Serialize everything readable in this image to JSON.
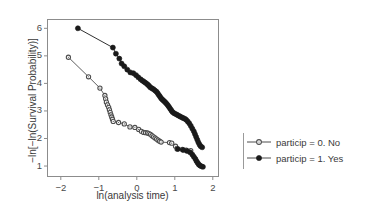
{
  "chart_data": {
    "type": "line",
    "title": "",
    "xlabel": "ln(analysis time)",
    "ylabel": "−ln[−ln(Survival Probability)]",
    "xlim": [
      -2.35,
      2.15
    ],
    "ylim": [
      0.62,
      6.32
    ],
    "xticks": [
      -2,
      -1,
      0,
      1,
      2
    ],
    "xticklabels": [
      "−2",
      "−1",
      "0",
      "1",
      "2"
    ],
    "yticks": [
      1,
      2,
      3,
      4,
      5,
      6
    ],
    "yticklabels": [
      "1",
      "2",
      "3",
      "4",
      "5",
      "6"
    ],
    "grid": false,
    "legend_position": "right",
    "frame": true,
    "series": [
      {
        "name": "particip = 0. No",
        "marker": "open-circle",
        "color": "#4d4d4d",
        "points": [
          [
            -1.8,
            4.95
          ],
          [
            -1.27,
            4.24
          ],
          [
            -0.97,
            3.83
          ],
          [
            -0.84,
            3.56
          ],
          [
            -0.82,
            3.44
          ],
          [
            -0.8,
            3.32
          ],
          [
            -0.77,
            3.22
          ],
          [
            -0.74,
            3.13
          ],
          [
            -0.72,
            3.04
          ],
          [
            -0.7,
            2.95
          ],
          [
            -0.68,
            2.86
          ],
          [
            -0.66,
            2.78
          ],
          [
            -0.64,
            2.7
          ],
          [
            -0.62,
            2.62
          ],
          [
            -0.48,
            2.58
          ],
          [
            -0.33,
            2.53
          ],
          [
            -0.18,
            2.42
          ],
          [
            -0.05,
            2.4
          ],
          [
            0.05,
            2.33
          ],
          [
            0.12,
            2.26
          ],
          [
            0.18,
            2.22
          ],
          [
            0.23,
            2.21
          ],
          [
            0.28,
            2.2
          ],
          [
            0.32,
            2.18
          ],
          [
            0.36,
            2.15
          ],
          [
            0.4,
            2.1
          ],
          [
            0.44,
            2.06
          ],
          [
            0.48,
            2.02
          ],
          [
            0.52,
            1.98
          ],
          [
            0.56,
            1.94
          ],
          [
            0.6,
            1.9
          ],
          [
            0.64,
            1.87
          ],
          [
            0.86,
            1.85
          ],
          [
            0.92,
            1.83
          ],
          [
            1.02,
            1.72
          ],
          [
            1.06,
            1.62
          ],
          [
            1.2,
            1.6
          ],
          [
            1.3,
            1.58
          ],
          [
            1.42,
            1.56
          ]
        ]
      },
      {
        "name": "particip = 1. Yes",
        "marker": "filled-circle",
        "color": "#1a1a1a",
        "points": [
          [
            -1.55,
            6.0
          ],
          [
            -0.63,
            5.3
          ],
          [
            -0.55,
            5.08
          ],
          [
            -0.46,
            4.9
          ],
          [
            -0.4,
            4.72
          ],
          [
            -0.33,
            4.62
          ],
          [
            -0.25,
            4.5
          ],
          [
            -0.17,
            4.4
          ],
          [
            -0.09,
            4.37
          ],
          [
            -0.02,
            4.3
          ],
          [
            0.04,
            4.22
          ],
          [
            0.1,
            4.15
          ],
          [
            0.15,
            4.1
          ],
          [
            0.19,
            4.06
          ],
          [
            0.23,
            4.02
          ],
          [
            0.27,
            3.98
          ],
          [
            0.3,
            3.94
          ],
          [
            0.33,
            3.9
          ],
          [
            0.36,
            3.85
          ],
          [
            0.4,
            3.82
          ],
          [
            0.44,
            3.79
          ],
          [
            0.48,
            3.74
          ],
          [
            0.52,
            3.7
          ],
          [
            0.55,
            3.64
          ],
          [
            0.58,
            3.58
          ],
          [
            0.61,
            3.52
          ],
          [
            0.64,
            3.46
          ],
          [
            0.67,
            3.42
          ],
          [
            0.7,
            3.38
          ],
          [
            0.73,
            3.34
          ],
          [
            0.76,
            3.3
          ],
          [
            0.79,
            3.25
          ],
          [
            0.82,
            3.2
          ],
          [
            0.85,
            3.14
          ],
          [
            0.88,
            3.08
          ],
          [
            0.91,
            3.02
          ],
          [
            0.94,
            2.96
          ],
          [
            0.98,
            2.92
          ],
          [
            1.02,
            2.89
          ],
          [
            1.06,
            2.86
          ],
          [
            1.1,
            2.83
          ],
          [
            1.14,
            2.8
          ],
          [
            1.18,
            2.77
          ],
          [
            1.22,
            2.74
          ],
          [
            1.26,
            2.72
          ],
          [
            1.3,
            2.68
          ],
          [
            1.34,
            2.62
          ],
          [
            1.38,
            2.55
          ],
          [
            1.42,
            2.46
          ],
          [
            1.46,
            2.36
          ],
          [
            1.5,
            2.26
          ],
          [
            1.53,
            2.16
          ],
          [
            1.56,
            2.06
          ],
          [
            1.59,
            1.96
          ],
          [
            1.62,
            1.86
          ],
          [
            1.65,
            1.78
          ],
          [
            1.68,
            1.72
          ],
          [
            1.72,
            1.68
          ]
        ]
      },
      {
        "name": "particip = 1. Yes (lower tail)",
        "marker": "filled-circle",
        "color": "#1a1a1a",
        "hidden_in_legend": true,
        "points": [
          [
            1.08,
            1.62
          ],
          [
            1.22,
            1.58
          ],
          [
            1.32,
            1.55
          ],
          [
            1.4,
            1.5
          ],
          [
            1.46,
            1.42
          ],
          [
            1.5,
            1.34
          ],
          [
            1.54,
            1.26
          ],
          [
            1.57,
            1.18
          ],
          [
            1.6,
            1.12
          ],
          [
            1.63,
            1.06
          ],
          [
            1.66,
            1.02
          ],
          [
            1.7,
            0.99
          ],
          [
            1.74,
            0.97
          ]
        ]
      }
    ]
  },
  "legend": {
    "items": [
      {
        "label": "particip = 0. No",
        "marker": "open-circle"
      },
      {
        "label": "particip = 1. Yes",
        "marker": "filled-circle"
      }
    ]
  }
}
